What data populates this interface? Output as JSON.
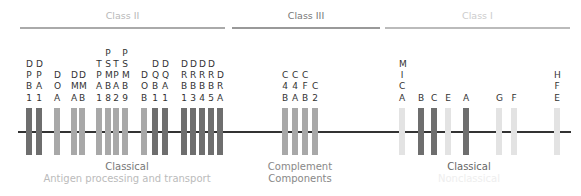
{
  "headers": [
    {
      "label": "Class II",
      "x": 20,
      "w": 205,
      "color": "#b8b8b8",
      "line_color": "#aaaaaa"
    },
    {
      "label": "Class III",
      "x": 232,
      "w": 148,
      "color": "#777777",
      "line_color": "#999999"
    },
    {
      "label": "Class I",
      "x": 385,
      "w": 185,
      "color": "#cccccc",
      "line_color": "#bbbbbb"
    }
  ],
  "colors": {
    "dark": "#6e6e6e",
    "medium": "#a8a8a8",
    "light": "#e3e3e3",
    "line": "#333333"
  },
  "genes": [
    {
      "letters": [
        "D",
        "P",
        "B",
        "1"
      ],
      "x": 26,
      "shade": "dark"
    },
    {
      "letters": [
        "D",
        "P",
        "A",
        "1"
      ],
      "x": 36,
      "shade": "dark"
    },
    {
      "letters": [
        "D",
        "O",
        "A"
      ],
      "x": 54,
      "shade": "medium"
    },
    {
      "letters": [
        "D",
        "M",
        "A"
      ],
      "x": 71,
      "shade": "medium"
    },
    {
      "letters": [
        "D",
        "M",
        "B"
      ],
      "x": 79,
      "shade": "medium"
    },
    {
      "letters": [
        "T",
        "P",
        "A",
        "1"
      ],
      "x": 96,
      "shade": "medium"
    },
    {
      "letters": [
        "P",
        "S",
        "M",
        "B",
        "8"
      ],
      "x": 105,
      "shade": "medium"
    },
    {
      "letters": [
        "T",
        "P",
        "A",
        "2"
      ],
      "x": 113,
      "shade": "medium"
    },
    {
      "letters": [
        "P",
        "S",
        "M",
        "B",
        "9"
      ],
      "x": 122,
      "shade": "medium"
    },
    {
      "letters": [
        "D",
        "O",
        "B"
      ],
      "x": 141,
      "shade": "medium"
    },
    {
      "letters": [
        "D",
        "Q",
        "B",
        "1"
      ],
      "x": 152,
      "shade": "dark"
    },
    {
      "letters": [
        "D",
        "Q",
        "A",
        "1"
      ],
      "x": 162,
      "shade": "dark"
    },
    {
      "letters": [
        "D",
        "R",
        "B",
        "1"
      ],
      "x": 181,
      "shade": "dark"
    },
    {
      "letters": [
        "D",
        "R",
        "B",
        "3"
      ],
      "x": 190,
      "shade": "dark"
    },
    {
      "letters": [
        "D",
        "R",
        "B",
        "4"
      ],
      "x": 199,
      "shade": "dark"
    },
    {
      "letters": [
        "D",
        "R",
        "B",
        "5"
      ],
      "x": 208,
      "shade": "dark"
    },
    {
      "letters": [
        "D",
        "R",
        "A"
      ],
      "x": 217,
      "shade": "dark"
    },
    {
      "letters": [
        "C",
        "4",
        "B"
      ],
      "x": 282,
      "shade": "medium"
    },
    {
      "letters": [
        "C",
        "4",
        "A"
      ],
      "x": 292,
      "shade": "medium"
    },
    {
      "letters": [
        "C",
        "F",
        "B"
      ],
      "x": 302,
      "shade": "medium"
    },
    {
      "letters": [
        "C",
        "2"
      ],
      "x": 312,
      "shade": "medium"
    },
    {
      "letters": [
        "M",
        "I",
        "C",
        "A"
      ],
      "x": 399,
      "shade": "light"
    },
    {
      "letters": [
        "B"
      ],
      "x": 418,
      "shade": "dark"
    },
    {
      "letters": [
        "C"
      ],
      "x": 431,
      "shade": "dark"
    },
    {
      "letters": [
        "E"
      ],
      "x": 445,
      "shade": "light"
    },
    {
      "letters": [
        "A"
      ],
      "x": 463,
      "shade": "dark"
    },
    {
      "letters": [
        "G"
      ],
      "x": 496,
      "shade": "light"
    },
    {
      "letters": [
        "F"
      ],
      "x": 511,
      "shade": "light"
    },
    {
      "letters": [
        "H",
        "F",
        "E"
      ],
      "x": 554,
      "shade": "light"
    }
  ],
  "bottom_labels": [
    {
      "lines": [
        {
          "text": "Classical",
          "color": "#777777"
        },
        {
          "text": "Antigen processing and transport",
          "color": "#bbbbbb"
        }
      ],
      "cx": 127,
      "y": 161
    },
    {
      "lines": [
        {
          "text": "Complement",
          "color": "#888888"
        },
        {
          "text": "Components",
          "color": "#888888"
        }
      ],
      "cx": 300,
      "y": 161
    },
    {
      "lines": [
        {
          "text": "Classical",
          "color": "#666666"
        },
        {
          "text": "Nonclassical",
          "color": "#eeeeee"
        }
      ],
      "cx": 469,
      "y": 161
    }
  ]
}
